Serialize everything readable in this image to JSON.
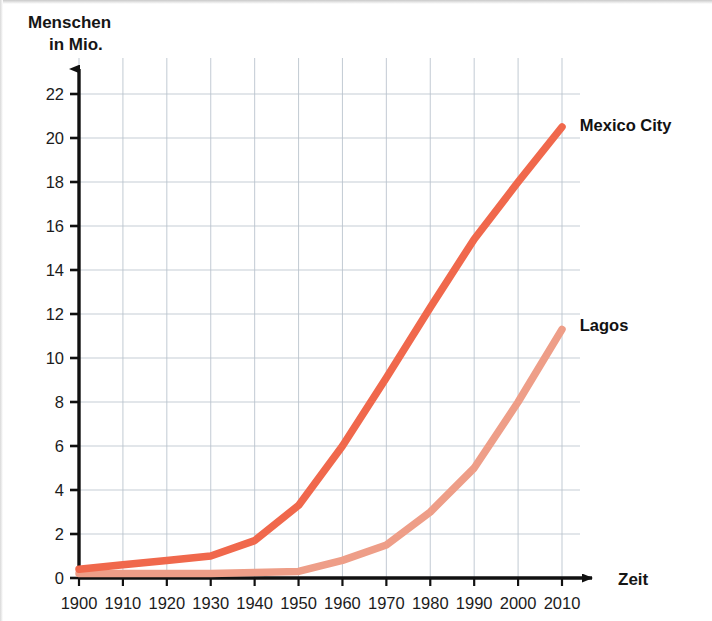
{
  "chart_data": {
    "type": "line",
    "title": "",
    "subtitle": "",
    "ylabel_line1": "Menschen",
    "ylabel_line2": "in Mio.",
    "xlabel": "Zeit",
    "x": [
      1900,
      1910,
      1920,
      1930,
      1940,
      1950,
      1960,
      1970,
      1980,
      1990,
      2000,
      2010
    ],
    "xtick_labels": [
      "1900",
      "1910",
      "1920",
      "1930",
      "1940",
      "1950",
      "1960",
      "1970",
      "1980",
      "1990",
      "2000",
      "2010"
    ],
    "ytick_labels": [
      "0",
      "2",
      "4",
      "6",
      "8",
      "10",
      "12",
      "14",
      "16",
      "18",
      "20",
      "22"
    ],
    "ytick_values": [
      0,
      2,
      4,
      6,
      8,
      10,
      12,
      14,
      16,
      18,
      20,
      22
    ],
    "xlim": [
      1900,
      2010
    ],
    "ylim": [
      0,
      22
    ],
    "grid": true,
    "grid_color": "#b9c3cd",
    "legend_position": "inline-right-of-line-end",
    "series": [
      {
        "name": "Mexico City",
        "color": "#F0684C",
        "label_x": 2012,
        "label_y": 20.6,
        "values": [
          0.4,
          0.6,
          0.8,
          1.0,
          1.7,
          3.3,
          6.0,
          9.1,
          12.3,
          15.4,
          18.0,
          20.5
        ]
      },
      {
        "name": "Lagos",
        "color": "#EE9E88",
        "label_x": 2012,
        "label_y": 11.5,
        "values": [
          0.2,
          0.2,
          0.2,
          0.2,
          0.25,
          0.3,
          0.8,
          1.5,
          3.0,
          5.0,
          8.0,
          11.3
        ]
      }
    ]
  },
  "axes": {
    "y_arrow": "y-axis-arrow",
    "x_arrow": "x-axis-arrow",
    "axis_color": "#111111"
  }
}
